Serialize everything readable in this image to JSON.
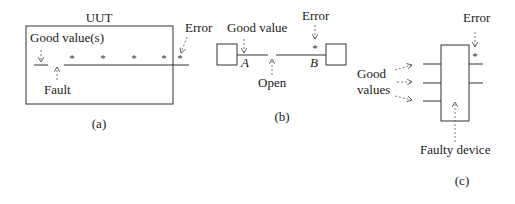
{
  "panel_a": {
    "title": "UUT",
    "good_values_label": "Good value(s)",
    "fault_label": "Fault",
    "error_label": "Error",
    "caption": "(a)",
    "error_marker": "*"
  },
  "panel_b": {
    "good_value_label": "Good value",
    "error_label": "Error",
    "open_label": "Open",
    "point_a": "A",
    "point_b": "B",
    "caption": "(b)",
    "error_marker": "*"
  },
  "panel_c": {
    "good_values_label_line1": "Good",
    "good_values_label_line2": "values",
    "error_label": "Error",
    "faulty_device_label": "Faulty device",
    "caption": "(c)",
    "error_marker": "*"
  },
  "colors": {
    "line": "#333333",
    "text": "#1a1a1a",
    "background": "#ffffff"
  }
}
